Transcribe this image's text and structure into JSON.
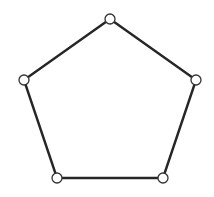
{
  "diagram": {
    "type": "graph",
    "shape": "pentagon",
    "colors": {
      "edge": "#262626",
      "node_fill": "#ffffff",
      "node_stroke": "#333333",
      "background": "#ffffff"
    },
    "nodes": [
      {
        "id": "top",
        "x": 110,
        "y": 19
      },
      {
        "id": "right",
        "x": 196,
        "y": 80
      },
      {
        "id": "bottom-right",
        "x": 163,
        "y": 178
      },
      {
        "id": "bottom-left",
        "x": 57,
        "y": 178
      },
      {
        "id": "left",
        "x": 24,
        "y": 80
      }
    ],
    "edges": [
      [
        "top",
        "right"
      ],
      [
        "right",
        "bottom-right"
      ],
      [
        "bottom-right",
        "bottom-left"
      ],
      [
        "bottom-left",
        "left"
      ],
      [
        "left",
        "top"
      ]
    ]
  }
}
